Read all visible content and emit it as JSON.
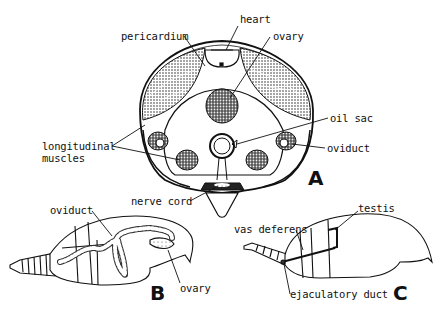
{
  "figure": {
    "panels": [
      {
        "id": "A",
        "label": "A",
        "description": "cross-section of abdomen"
      },
      {
        "id": "B",
        "label": "B",
        "description": "female abdomen lateral view"
      },
      {
        "id": "C",
        "label": "C",
        "description": "male abdomen lateral view"
      }
    ],
    "panel_a": {
      "labels": {
        "heart": "heart",
        "pericardium": "pericardium",
        "ovary": "ovary",
        "oil_sac": "oil sac",
        "oviduct": "oviduct",
        "longitudinal_1": "longitudinal",
        "longitudinal_2": "muscles",
        "nerve_cord": "nerve cord"
      },
      "letter": "A"
    },
    "panel_b": {
      "labels": {
        "oviduct": "oviduct",
        "ovary": "ovary"
      },
      "letter": "B"
    },
    "panel_c": {
      "labels": {
        "testis": "testis",
        "vas_deferens": "vas deferens",
        "ejaculatory_duct": "ejaculatory duct"
      },
      "letter": "C"
    }
  }
}
